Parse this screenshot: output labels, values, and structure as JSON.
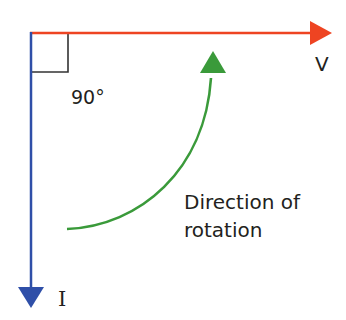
{
  "diagram": {
    "angle_label": "90°",
    "voltage_label": "V",
    "current_label": "I",
    "rotation_label_line1": "Direction of",
    "rotation_label_line2": "rotation",
    "colors": {
      "voltage_vector": "#ee4422",
      "current_vector": "#2f4fa8",
      "rotation_arrow": "#3a9a3a",
      "right_angle_marker": "#333333",
      "text": "#231f20"
    }
  }
}
